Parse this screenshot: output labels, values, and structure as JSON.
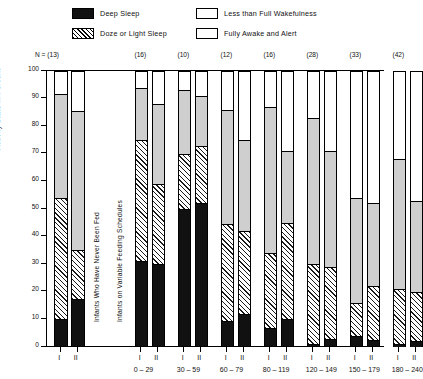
{
  "legend": {
    "items": [
      {
        "key": "deep",
        "label": "Deep Sleep",
        "swatch": "deep"
      },
      {
        "key": "doze",
        "label": "Doze or Light Sleep",
        "swatch": "doze"
      },
      {
        "key": "less",
        "label": "Less than Full Wakefulness",
        "swatch": "open"
      },
      {
        "key": "awake",
        "label": "Fully Awake and Alert",
        "swatch": "open"
      }
    ]
  },
  "axis": {
    "y_title": "Activity State in Percent",
    "y_ticks": [
      "100",
      "90",
      "80",
      "70",
      "60",
      "50",
      "40",
      "30",
      "20",
      "10",
      "0"
    ],
    "n_prefix": "N = "
  },
  "annotations": [
    {
      "text": "Infants Who Have Never Been Fed"
    },
    {
      "text": "Infants on Variable Feeding Schedules"
    }
  ],
  "chart_data": {
    "type": "bar",
    "title": "",
    "xlabel": "",
    "ylabel": "Activity State in Percent",
    "ylim": [
      0,
      100
    ],
    "grid": false,
    "legend_position": "top",
    "stacked": true,
    "sub_labels": [
      "I",
      "II"
    ],
    "series_order": [
      "deep",
      "doze",
      "less",
      "awake"
    ],
    "series": [
      {
        "name": "Deep Sleep",
        "key": "deep",
        "color": "#111111"
      },
      {
        "name": "Doze or Light Sleep",
        "key": "doze",
        "color": "hatch"
      },
      {
        "name": "Less than Full Wakefulness",
        "key": "less",
        "color": "#cfcfcf"
      },
      {
        "name": "Fully Awake and Alert",
        "key": "awake",
        "color": "#ffffff"
      }
    ],
    "groups": [
      {
        "n": "(13)",
        "n_label": "N = (13)",
        "category": "",
        "bars": [
          {
            "sub": "I",
            "deep": 10.0,
            "doze": 44.0,
            "less": 37.5,
            "awake": 8.5
          },
          {
            "sub": "II",
            "deep": 17.5,
            "doze": 17.5,
            "less": 50.5,
            "awake": 14.5
          }
        ]
      },
      {
        "n": "(16)",
        "n_label": "(16)",
        "category": "0 – 29",
        "bars": [
          {
            "sub": "I",
            "deep": 31.0,
            "doze": 44.0,
            "less": 19.0,
            "awake": 6.0
          },
          {
            "sub": "II",
            "deep": 30.0,
            "doze": 29.0,
            "less": 29.0,
            "awake": 12.0
          }
        ]
      },
      {
        "n": "(10)",
        "n_label": "(10)",
        "category": "30 – 59",
        "bars": [
          {
            "sub": "I",
            "deep": 50.0,
            "doze": 20.0,
            "less": 23.0,
            "awake": 7.0
          },
          {
            "sub": "II",
            "deep": 52.0,
            "doze": 21.0,
            "less": 18.0,
            "awake": 9.0
          }
        ]
      },
      {
        "n": "(12)",
        "n_label": "(12)",
        "category": "60 – 79",
        "bars": [
          {
            "sub": "I",
            "deep": 9.5,
            "doze": 35.0,
            "less": 41.5,
            "awake": 14.0
          },
          {
            "sub": "II",
            "deep": 12.0,
            "doze": 30.0,
            "less": 33.0,
            "awake": 25.0
          }
        ]
      },
      {
        "n": "(16)",
        "n_label": "(16)",
        "category": "80 – 119",
        "bars": [
          {
            "sub": "I",
            "deep": 7.0,
            "doze": 27.0,
            "less": 53.0,
            "awake": 13.0
          },
          {
            "sub": "II",
            "deep": 10.0,
            "doze": 35.0,
            "less": 26.0,
            "awake": 29.0
          }
        ]
      },
      {
        "n": "(28)",
        "n_label": "(28)",
        "category": "120 – 149",
        "bars": [
          {
            "sub": "I",
            "deep": 1.0,
            "doze": 29.0,
            "less": 53.0,
            "awake": 17.0
          },
          {
            "sub": "II",
            "deep": 3.0,
            "doze": 26.0,
            "less": 42.0,
            "awake": 29.0
          }
        ]
      },
      {
        "n": "(33)",
        "n_label": "(33)",
        "category": "150 – 179",
        "bars": [
          {
            "sub": "I",
            "deep": 4.0,
            "doze": 12.0,
            "less": 38.0,
            "awake": 46.0
          },
          {
            "sub": "II",
            "deep": 2.5,
            "doze": 19.5,
            "less": 30.0,
            "awake": 48.0
          }
        ]
      },
      {
        "n": "(42)",
        "n_label": "(42)",
        "category": "180 – 240",
        "bars": [
          {
            "sub": "I",
            "deep": 1.0,
            "doze": 20.0,
            "less": 47.0,
            "awake": 32.0
          },
          {
            "sub": "II",
            "deep": 2.0,
            "doze": 18.0,
            "less": 33.0,
            "awake": 47.0
          }
        ]
      }
    ]
  }
}
